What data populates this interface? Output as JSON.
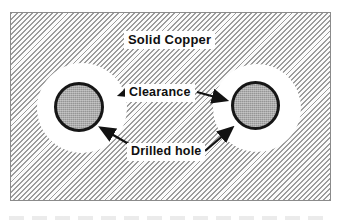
{
  "figure": {
    "type": "pcb-copper-clearance-diagram",
    "labels": {
      "solid_copper": "Solid Copper",
      "clearance": "Clearance",
      "drilled_hole": "Drilled hole"
    },
    "elements": {
      "copper_plane": "hatched region representing solid copper",
      "clearance_rings": 2,
      "drilled_holes": 2
    },
    "colors": {
      "background": "#ffffff",
      "hatch_line": "#9c9c9c",
      "plane_border": "#8b8b8b",
      "clearance_fill": "#ffffff",
      "hole_fill": "#ababab",
      "hole_ring": "#161616",
      "label_text": "#0f0f0f",
      "arrow": "#121212"
    }
  }
}
